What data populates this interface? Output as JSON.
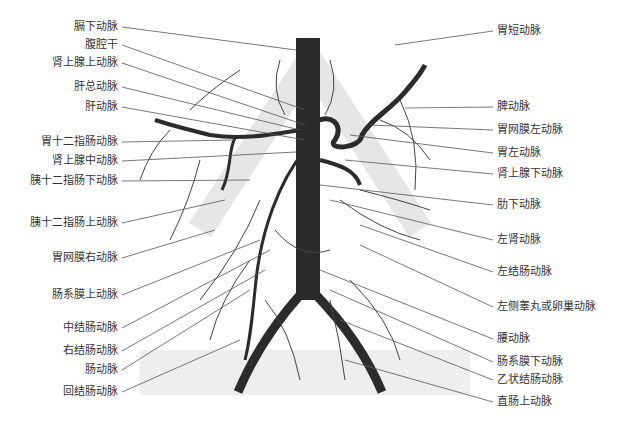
{
  "diagram": {
    "left_labels": [
      "膈下动脉",
      "腹腔干",
      "肾上腺上动脉",
      "肝总动脉",
      "肝动脉",
      "胃十二指肠动脉",
      "肾上腺中动脉",
      "胰十二指肠下动脉",
      "胰十二指肠上动脉",
      "胃网膜右动脉",
      "肠系膜上动脉",
      "中结肠动脉",
      "右结肠动脉",
      "肠动脉",
      "回结肠动脉"
    ],
    "right_labels": [
      "胃短动脉",
      "脾动脉",
      "胃网膜左动脉",
      "胃左动脉",
      "肾上腺下动脉",
      "肋下动脉",
      "左肾动脉",
      "左结肠动脉",
      "左侧睾丸或卵巢动脉",
      "腰动脉",
      "肠系膜下动脉",
      "乙状结肠动脉",
      "直肠上动脉"
    ],
    "colors": {
      "vessel": "#2b2b2b",
      "branch": "#444444",
      "leader": "#555555",
      "watermark": "#e6e6e6"
    }
  }
}
